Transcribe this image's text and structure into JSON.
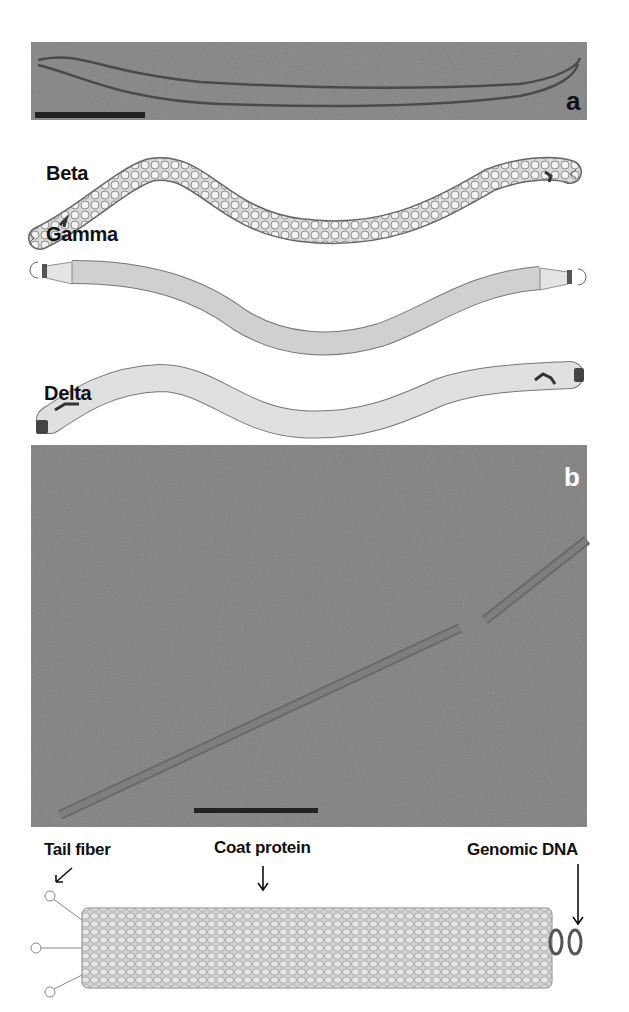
{
  "figure": {
    "panel_a": {
      "letter": "a",
      "type": "electron micrograph",
      "scale_bar": true
    },
    "schematics": [
      {
        "label": "Beta"
      },
      {
        "label": "Gamma"
      },
      {
        "label": "Delta"
      }
    ],
    "panel_b": {
      "letter": "b",
      "type": "electron micrograph",
      "scale_bar": true
    },
    "model": {
      "annotations": [
        {
          "label": "Tail fiber"
        },
        {
          "label": "Coat protein"
        },
        {
          "label": "Genomic DNA"
        }
      ]
    },
    "colors": {
      "micrograph_gray": "#8f8f8f",
      "schematic_fill": "#d8d8d8",
      "outline": "#555555",
      "text": "#111111"
    }
  }
}
